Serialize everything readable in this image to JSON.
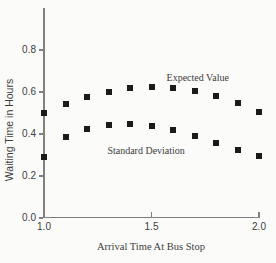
{
  "figure_bg": "#fbfbfa",
  "colors": {
    "marker": "#1b1b1b",
    "axis": "#808080",
    "text": "#3d3d3d"
  },
  "chart_data": {
    "type": "scatter",
    "title": "",
    "xlabel": "Arrival Time At Bus Stop",
    "ylabel": "Waiting Time in Hours",
    "xlim": [
      1.0,
      2.0
    ],
    "ylim": [
      0.0,
      1.0
    ],
    "grid": false,
    "marker_shape": "filled-square",
    "xticks": [
      "1.0",
      "1.5",
      "2.0"
    ],
    "xtick_values": [
      1.0,
      1.5,
      2.0
    ],
    "yticks": [
      "0.0",
      "0.2",
      "0.4",
      "0.6",
      "0.8"
    ],
    "ytick_values": [
      0.0,
      0.2,
      0.4,
      0.6,
      0.8
    ],
    "x": [
      1.0,
      1.1,
      1.2,
      1.3,
      1.4,
      1.5,
      1.6,
      1.7,
      1.8,
      1.9,
      2.0
    ],
    "series": [
      {
        "name": "Expected Value",
        "values": [
          0.5,
          0.545,
          0.575,
          0.6,
          0.62,
          0.625,
          0.62,
          0.605,
          0.58,
          0.55,
          0.505
        ],
        "label_anchor": {
          "x": 1.715,
          "y": 0.672
        }
      },
      {
        "name": "Standard Deviation",
        "values": [
          0.29,
          0.385,
          0.425,
          0.445,
          0.45,
          0.44,
          0.42,
          0.39,
          0.355,
          0.325,
          0.295
        ],
        "label_anchor": {
          "x": 1.475,
          "y": 0.325
        }
      }
    ],
    "legend": "inline-annotations"
  }
}
